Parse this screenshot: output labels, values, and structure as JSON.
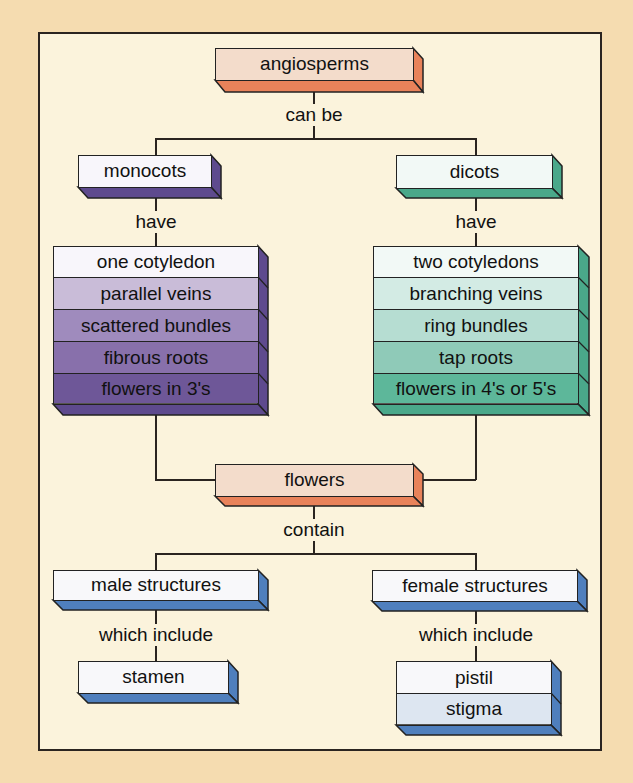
{
  "diagram": {
    "type": "concept-map",
    "root": {
      "label": "angiosperms",
      "link": "can be"
    },
    "monocots": {
      "label": "monocots",
      "link": "have",
      "traits": [
        "one cotyledon",
        "parallel veins",
        "scattered bundles",
        "fibrous roots",
        "flowers in 3's"
      ]
    },
    "dicots": {
      "label": "dicots",
      "link": "have",
      "traits": [
        "two cotyledons",
        "branching veins",
        "ring bundles",
        "tap roots",
        "flowers in 4's or 5's"
      ]
    },
    "flowers": {
      "label": "flowers",
      "link": "contain"
    },
    "male": {
      "label": "male structures",
      "link": "which include",
      "parts": [
        "stamen"
      ]
    },
    "female": {
      "label": "female structures",
      "link": "which include",
      "parts": [
        "pistil",
        "stigma"
      ]
    }
  },
  "colors": {
    "page_bg": "#f5dcb0",
    "frame_bg": "#fbf3dc",
    "angiosperm_face": "#f3dccb",
    "angiosperm_side": "#e8825a",
    "monocot_side": "#5e4a8e",
    "monocot_rows": [
      "#f8f6fb",
      "#c9bcd8",
      "#9f8bbd",
      "#8870ab",
      "#6e5798"
    ],
    "dicot_side": "#4aa88a",
    "dicot_rows": [
      "#f2f9f6",
      "#d3ebe4",
      "#b6ddd2",
      "#8fcab8",
      "#5db79a"
    ],
    "blue_side": "#4f7fbd",
    "blue_rows": [
      "#f8f8fa",
      "#dde6f1"
    ]
  }
}
